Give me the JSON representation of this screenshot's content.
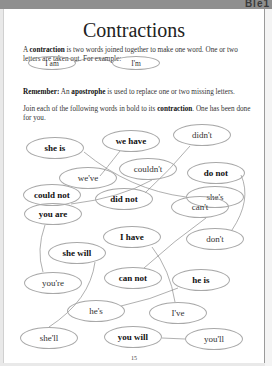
{
  "header": {
    "corner_text": "Ble1"
  },
  "worksheet": {
    "title": "Contractions",
    "intro": {
      "prefix": "A ",
      "term": "contraction",
      "suffix": " is two words joined together to make one word. One or two letters are taken out. For example:"
    },
    "example": {
      "full": "I am",
      "contraction": "I'm"
    },
    "remember": {
      "label": "Remember:",
      "prefix": " An ",
      "term": "apostrophe",
      "suffix": " is used to replace one or two missing letters."
    },
    "instruction": {
      "prefix": "Join each of the following words in bold to its ",
      "term": "contraction",
      "suffix": ". One has been done for you."
    },
    "ovals": [
      {
        "text": "she is",
        "bold": true,
        "x": 26,
        "y": 137,
        "w": 58,
        "h": 22
      },
      {
        "text": "we have",
        "bold": true,
        "x": 102,
        "y": 130,
        "w": 58,
        "h": 22
      },
      {
        "text": "didn't",
        "bold": false,
        "x": 173,
        "y": 124,
        "w": 58,
        "h": 22
      },
      {
        "text": "couldn't",
        "bold": false,
        "x": 119,
        "y": 158,
        "w": 58,
        "h": 22
      },
      {
        "text": "do not",
        "bold": true,
        "x": 187,
        "y": 162,
        "w": 58,
        "h": 22
      },
      {
        "text": "we've",
        "bold": false,
        "x": 59,
        "y": 167,
        "w": 58,
        "h": 22
      },
      {
        "text": "she's",
        "bold": false,
        "x": 186,
        "y": 186,
        "w": 58,
        "h": 22
      },
      {
        "text": "could not",
        "bold": true,
        "x": 23,
        "y": 184,
        "w": 58,
        "h": 22
      },
      {
        "text": "did not",
        "bold": true,
        "x": 95,
        "y": 188,
        "w": 58,
        "h": 22
      },
      {
        "text": "can't",
        "bold": false,
        "x": 171,
        "y": 196,
        "w": 58,
        "h": 22
      },
      {
        "text": "you are",
        "bold": true,
        "x": 24,
        "y": 203,
        "w": 58,
        "h": 22
      },
      {
        "text": "I have",
        "bold": true,
        "x": 103,
        "y": 226,
        "w": 58,
        "h": 22
      },
      {
        "text": "don't",
        "bold": false,
        "x": 186,
        "y": 228,
        "w": 58,
        "h": 22
      },
      {
        "text": "she will",
        "bold": true,
        "x": 48,
        "y": 242,
        "w": 58,
        "h": 22
      },
      {
        "text": "you're",
        "bold": false,
        "x": 24,
        "y": 272,
        "w": 58,
        "h": 22
      },
      {
        "text": "can not",
        "bold": true,
        "x": 104,
        "y": 267,
        "w": 58,
        "h": 22
      },
      {
        "text": "he is",
        "bold": true,
        "x": 172,
        "y": 269,
        "w": 58,
        "h": 22
      },
      {
        "text": "he's",
        "bold": false,
        "x": 67,
        "y": 300,
        "w": 58,
        "h": 22
      },
      {
        "text": "I've",
        "bold": false,
        "x": 149,
        "y": 302,
        "w": 58,
        "h": 22
      },
      {
        "text": "she'll",
        "bold": false,
        "x": 20,
        "y": 327,
        "w": 58,
        "h": 22
      },
      {
        "text": "you will",
        "bold": true,
        "x": 104,
        "y": 326,
        "w": 58,
        "h": 22
      },
      {
        "text": "you'll",
        "bold": false,
        "x": 185,
        "y": 328,
        "w": 58,
        "h": 22
      }
    ],
    "page_number": "15"
  }
}
